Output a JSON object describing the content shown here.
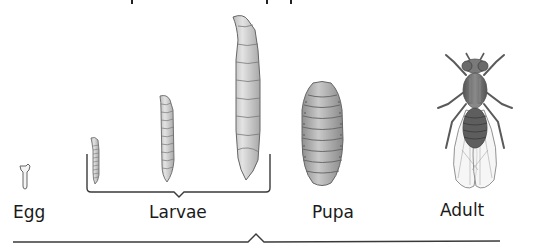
{
  "diagram": {
    "type": "life-cycle",
    "stages": [
      {
        "id": "egg",
        "label": "Egg"
      },
      {
        "id": "larvae",
        "label": "Larvae",
        "count": 3
      },
      {
        "id": "pupa",
        "label": "Pupa"
      },
      {
        "id": "adult",
        "label": "Adult"
      }
    ],
    "top_partial_text": "p p",
    "colors": {
      "stroke": "#555555",
      "fill_light": "#d6d6d6",
      "fill_mid": "#a9a9a9",
      "fill_dark": "#6e6e6e",
      "text": "#1a1a1a",
      "bracket": "#3a3a3a"
    }
  }
}
